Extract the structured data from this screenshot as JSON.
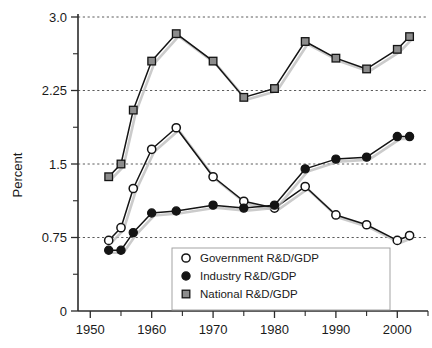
{
  "chart_data": {
    "type": "line",
    "title": "",
    "xlabel": "",
    "ylabel": "Percent",
    "xlim": [
      1948,
      2005
    ],
    "ylim": [
      0,
      3.0
    ],
    "grid": true,
    "legend_position": "inside-bottom-center",
    "x": [
      1953,
      1955,
      1957,
      1960,
      1964,
      1970,
      1975,
      1980,
      1985,
      1990,
      1995,
      2000,
      2002
    ],
    "x_ticks": [
      1950,
      1960,
      1970,
      1980,
      1990,
      2000
    ],
    "x_tick_labels": [
      "1950",
      "1960",
      "1970",
      "1980",
      "1990",
      "2000"
    ],
    "x_minor_ticks": [
      1955,
      1965,
      1975,
      1985,
      1995
    ],
    "y_ticks": [
      0,
      0.75,
      1.5,
      2.25,
      3.0
    ],
    "y_tick_labels": [
      "0",
      "0.75",
      "1.5",
      "2.25",
      "3.0"
    ],
    "y_minor_ticks": [
      0.375,
      1.125,
      1.875,
      2.625
    ],
    "series": [
      {
        "name": "Government R&D/GDP",
        "marker": "open-circle",
        "color": "#141414",
        "values": [
          0.72,
          0.85,
          1.25,
          1.65,
          1.87,
          1.37,
          1.12,
          1.05,
          1.27,
          0.98,
          0.88,
          0.72,
          0.77
        ]
      },
      {
        "name": "Industry R&D/GDP",
        "marker": "filled-circle",
        "color": "#141414",
        "values": [
          0.62,
          0.62,
          0.8,
          1.0,
          1.02,
          1.08,
          1.05,
          1.08,
          1.45,
          1.55,
          1.57,
          1.78,
          1.78
        ]
      },
      {
        "name": "National R&D/GDP",
        "marker": "square",
        "color": "#141414",
        "values": [
          1.37,
          1.5,
          2.05,
          2.55,
          2.83,
          2.55,
          2.18,
          2.27,
          2.75,
          2.58,
          2.47,
          2.67,
          2.8
        ]
      }
    ]
  },
  "legend": {
    "entries": [
      {
        "label": "Government R&D/GDP",
        "marker": "open-circle"
      },
      {
        "label": "Industry R&D/GDP",
        "marker": "filled-circle"
      },
      {
        "label": "National R&D/GDP",
        "marker": "square"
      }
    ]
  },
  "colors": {
    "axis": "#2b2b2b",
    "grid": "#4a4a4a",
    "line": "#141414",
    "marker_fill_open": "#ffffff",
    "marker_fill_solid": "#141414",
    "marker_fill_square": "#8c8c8c",
    "background": "#ffffff",
    "shadow": "#b9b9b9"
  }
}
